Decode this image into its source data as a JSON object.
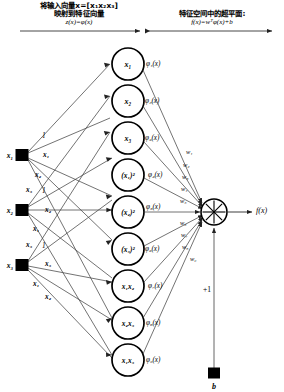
{
  "figure": {
    "headers": [
      {
        "cn_line1": "将输入向量x=[x₁x₂x₃]",
        "cn_line2": "映射到特征向量",
        "eq": "z(x)=φ(x)"
      },
      {
        "cn_line1": "特征空间中的超平面:",
        "cn_line2": "",
        "eq": "f(x)=wᵀφ(x)+b"
      }
    ],
    "input_nodes": [
      {
        "label": "x₁"
      },
      {
        "label": "x₂"
      },
      {
        "label": "x₃"
      }
    ],
    "input_edge_labels": [
      "1",
      "x₁",
      "x₂",
      "x₃",
      "1",
      "x₂",
      "x₁",
      "x₃",
      "1",
      "x₃",
      "x₁",
      "x₂"
    ],
    "feature_nodes": [
      {
        "label": "x₁",
        "phi": "φ₁(x)",
        "weight": "w₁"
      },
      {
        "label": "x₂",
        "phi": "φ₂(x)",
        "weight": "w₂"
      },
      {
        "label": "x₃",
        "phi": "φ₃(x)",
        "weight": "w₃"
      },
      {
        "label": "(x₁)²",
        "phi": "φ₄(x)",
        "weight": "w₄"
      },
      {
        "label": "(x₂)²",
        "phi": "φ₅(x)",
        "weight": "w₅"
      },
      {
        "label": "(x₃)²",
        "phi": "φ₆(x)",
        "weight": "w₆"
      },
      {
        "label": "x₁x₂",
        "phi": "φ₇(x)",
        "weight": "w₇"
      },
      {
        "label": "x₂x₃",
        "phi": "φ₈(x)",
        "weight": "w₈"
      },
      {
        "label": "x₁x₃",
        "phi": "φ₉(x)",
        "weight": "w₉"
      }
    ],
    "output": {
      "label": "f(x)",
      "symbol": "sum-junction"
    },
    "bias": {
      "node_label": "b",
      "edge_label": "+1"
    },
    "colors": {
      "ink": "#000000",
      "line": "#3a3a3a",
      "bg": "#ffffff"
    }
  }
}
